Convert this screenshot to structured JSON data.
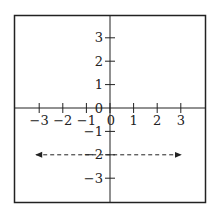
{
  "chart_data": {
    "type": "line",
    "title": "",
    "xlabel": "",
    "ylabel": "",
    "xlim": [
      -4,
      4
    ],
    "ylim": [
      -4,
      4
    ],
    "grid": false,
    "x_ticks": [
      -3,
      -2,
      -1,
      0,
      1,
      2,
      3
    ],
    "x_tick_labels": [
      "−3",
      "−2",
      "−1",
      "0",
      "1",
      "2",
      "3"
    ],
    "y_ticks": [
      3,
      2,
      1,
      0,
      -1,
      -2,
      -3
    ],
    "y_tick_labels": [
      "3",
      "2",
      "1",
      "0",
      "−1",
      "−2",
      "−3"
    ],
    "series": [
      {
        "name": "y = -2",
        "style": "dashed",
        "arrows": "both",
        "x": [
          -3,
          3
        ],
        "y": [
          -2,
          -2
        ]
      }
    ],
    "colors": {
      "axis": "#222222",
      "frame": "#222222",
      "line": "#222222"
    }
  }
}
